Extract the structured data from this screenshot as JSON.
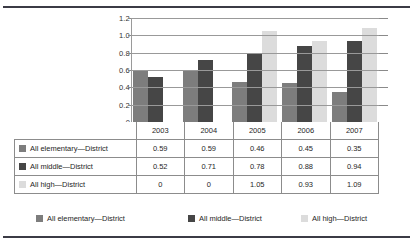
{
  "chart_data": {
    "type": "bar",
    "title": "",
    "xlabel": "",
    "ylabel": "",
    "categories": [
      "2003",
      "2004",
      "2005",
      "2006",
      "2007"
    ],
    "series": [
      {
        "name": "All elementary—District",
        "color": "#7d7d7d",
        "values": [
          0.59,
          0.59,
          0.46,
          0.45,
          0.35
        ]
      },
      {
        "name": "All middle—District",
        "color": "#464646",
        "values": [
          0.52,
          0.71,
          0.78,
          0.88,
          0.94
        ]
      },
      {
        "name": "All high—District",
        "color": "#dcdcdc",
        "values": [
          0,
          0,
          1.05,
          0.93,
          1.09
        ]
      }
    ],
    "ylim": [
      0,
      1.2
    ],
    "yticks": [
      "1.2",
      "1.0",
      "0.8",
      "0.6",
      "0.4",
      "0.2",
      "0"
    ],
    "ytick_values": [
      1.2,
      1.0,
      0.8,
      0.6,
      0.4,
      0.2,
      0
    ],
    "grid": true,
    "legend_position": "bottom",
    "data_table": {
      "header": [
        "",
        "2003",
        "2004",
        "2005",
        "2006",
        "2007"
      ],
      "rows": [
        {
          "label": "All elementary—District",
          "swatch": "s0",
          "cells": [
            "0.59",
            "0.59",
            "0.46",
            "0.45",
            "0.35"
          ]
        },
        {
          "label": "All middle—District",
          "swatch": "s1",
          "cells": [
            "0.52",
            "0.71",
            "0.78",
            "0.88",
            "0.94"
          ]
        },
        {
          "label": "All high—District",
          "swatch": "s2",
          "cells": [
            "0",
            "0",
            "1.05",
            "0.93",
            "1.09"
          ]
        }
      ]
    },
    "legend": [
      {
        "label": "All elementary—District",
        "swatch": "s0"
      },
      {
        "label": "All middle—District",
        "swatch": "s1"
      },
      {
        "label": "All high—District",
        "swatch": "s2"
      }
    ]
  }
}
